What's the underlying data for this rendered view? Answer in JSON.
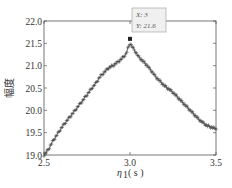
{
  "chart_data": {
    "type": "line",
    "title": "",
    "xlabel": "η₁ (s)",
    "xlabel_main": "η",
    "xlabel_sub": "1",
    "xlabel_unit": "( s )",
    "ylabel": "幅度",
    "xlim": [
      2.5,
      3.5
    ],
    "ylim": [
      19.0,
      22.0
    ],
    "xticks": [
      "2.5",
      "3.0",
      "3.5"
    ],
    "xtick_values": [
      2.5,
      3.0,
      3.5
    ],
    "yticks": [
      "19.0",
      "19.5",
      "20.0",
      "20.5",
      "21.0",
      "21.5",
      "22.0"
    ],
    "ytick_values": [
      19.0,
      19.5,
      20.0,
      20.5,
      21.0,
      21.5,
      22.0
    ],
    "grid": false,
    "marker": "+",
    "line_color": "#444444",
    "series": [
      {
        "name": "幅度",
        "x": [
          2.5,
          2.525,
          2.55,
          2.575,
          2.6,
          2.625,
          2.65,
          2.675,
          2.7,
          2.725,
          2.75,
          2.775,
          2.8,
          2.825,
          2.85,
          2.875,
          2.9,
          2.925,
          2.95,
          2.975,
          3.0,
          3.025,
          3.05,
          3.075,
          3.1,
          3.125,
          3.15,
          3.175,
          3.2,
          3.225,
          3.25,
          3.275,
          3.3,
          3.325,
          3.35,
          3.375,
          3.4,
          3.425,
          3.45,
          3.475,
          3.5
        ],
        "values": [
          19.0,
          19.12,
          19.3,
          19.45,
          19.6,
          19.73,
          19.85,
          19.97,
          20.1,
          20.22,
          20.35,
          20.48,
          20.6,
          20.75,
          20.85,
          20.95,
          21.0,
          21.07,
          21.15,
          21.25,
          21.5,
          21.35,
          21.2,
          21.1,
          21.0,
          20.88,
          20.75,
          20.65,
          20.55,
          20.48,
          20.4,
          20.3,
          20.2,
          20.1,
          20.0,
          19.9,
          19.8,
          19.72,
          19.65,
          19.62,
          19.58
        ]
      }
    ],
    "annotation": {
      "x": 3.0,
      "y": 21.6,
      "label_x": "X: 3",
      "label_y": "Y: 21.6"
    }
  }
}
